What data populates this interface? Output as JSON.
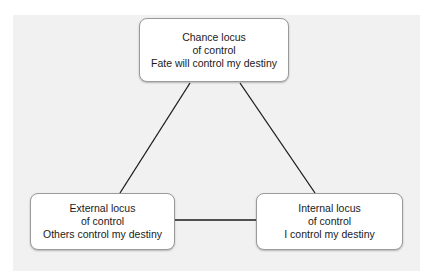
{
  "diagram": {
    "nodes": [
      {
        "id": "chance",
        "lines": [
          "Chance locus",
          "of control",
          "Fate will control my destiny"
        ]
      },
      {
        "id": "external",
        "lines": [
          "External locus",
          "of control",
          "Others control my destiny"
        ]
      },
      {
        "id": "internal",
        "lines": [
          "Internal locus",
          "of control",
          "I control my destiny"
        ]
      }
    ],
    "edges": [
      {
        "from": "chance",
        "to": "external"
      },
      {
        "from": "chance",
        "to": "internal"
      },
      {
        "from": "external",
        "to": "internal"
      }
    ],
    "colors": {
      "panel": "#f1f1f1",
      "box_border": "#9a9a9a",
      "line": "#1a1a1a"
    }
  }
}
